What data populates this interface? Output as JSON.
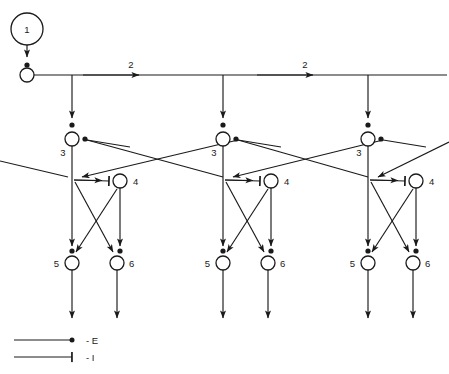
{
  "diagram": {
    "background_color": "#ffffff",
    "line_color": "#1a1a1a",
    "text_color": "#1a1a1a",
    "width": 449,
    "height": 374,
    "source_node": {
      "id": "1",
      "label": "1",
      "cx": 27,
      "cy": 29,
      "r": 16
    },
    "bus": {
      "y": 75,
      "x_start": 27,
      "x_end": 447,
      "junction": {
        "cx": 27,
        "cy": 75,
        "r": 7
      },
      "segment_labels": [
        {
          "label": "2",
          "x": 131,
          "y": 68
        },
        {
          "label": "2",
          "x": 305,
          "y": 68
        }
      ]
    },
    "columns": [
      {
        "index": 0,
        "x": 72,
        "node3_label": "3",
        "node4_label": "4",
        "node5_label": "5",
        "node6_label": "6"
      },
      {
        "index": 1,
        "x": 223,
        "node3_label": "3",
        "node4_label": "4",
        "node5_label": "5",
        "node6_label": "6"
      },
      {
        "index": 2,
        "x": 368,
        "node3_label": "3",
        "node4_label": "4",
        "node5_label": "5",
        "node6_label": "6"
      }
    ],
    "geometry": {
      "node3_y": 139,
      "junction_y": 178,
      "node4_dx": 48,
      "node4_y": 181,
      "node5_y": 263,
      "node6_dx": 45,
      "node6_y": 263,
      "node_radius": 7,
      "tail_end_y": 318
    },
    "legend": [
      {
        "symbol": "dot",
        "label": "- E",
        "meaning_label": "E"
      },
      {
        "symbol": "bar",
        "label": "- I",
        "meaning_label": "I"
      }
    ]
  }
}
